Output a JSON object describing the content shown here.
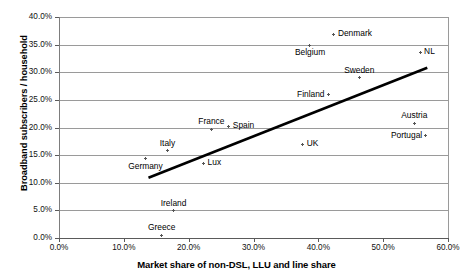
{
  "chart_data": {
    "type": "scatter",
    "title": "",
    "xlabel": "Market share of non-DSL, LLU and line share",
    "ylabel": "Broadband subscribers / household",
    "xlim": [
      0,
      60
    ],
    "ylim": [
      0,
      40
    ],
    "xticks": [
      "0.0%",
      "10.0%",
      "20.0%",
      "30.0%",
      "40.0%",
      "50.0%",
      "60.0%"
    ],
    "xtick_values": [
      0,
      10,
      20,
      30,
      40,
      50,
      60
    ],
    "yticks": [
      "0.0%",
      "5.0%",
      "10.0%",
      "15.0%",
      "20.0%",
      "25.0%",
      "30.0%",
      "35.0%",
      "40.0%"
    ],
    "ytick_values": [
      0,
      5,
      10,
      15,
      20,
      25,
      30,
      35,
      40
    ],
    "grid": "horizontal",
    "legend": "none",
    "marker": "plus",
    "points": [
      {
        "label": "Denmark",
        "x": 42.4,
        "y": 36.9,
        "label_pos": "right"
      },
      {
        "label": "Belgium",
        "x": 38.7,
        "y": 34.9,
        "label_pos": "below"
      },
      {
        "label": "NL",
        "x": 55.7,
        "y": 33.6,
        "label_pos": "right"
      },
      {
        "label": "Sweden",
        "x": 46.3,
        "y": 29.0,
        "label_pos": "above"
      },
      {
        "label": "Finland",
        "x": 41.5,
        "y": 26.0,
        "label_pos": "left"
      },
      {
        "label": "Austria",
        "x": 54.8,
        "y": 20.8,
        "label_pos": "above"
      },
      {
        "label": "Spain",
        "x": 26.2,
        "y": 20.2,
        "label_pos": "right"
      },
      {
        "label": "France",
        "x": 23.5,
        "y": 19.7,
        "label_pos": "above"
      },
      {
        "label": "Portugal",
        "x": 56.6,
        "y": 18.6,
        "label_pos": "left"
      },
      {
        "label": "UK",
        "x": 37.6,
        "y": 17.0,
        "label_pos": "right"
      },
      {
        "label": "Italy",
        "x": 16.7,
        "y": 15.8,
        "label_pos": "above"
      },
      {
        "label": "Germany",
        "x": 13.3,
        "y": 14.3,
        "label_pos": "below"
      },
      {
        "label": "Lux",
        "x": 22.3,
        "y": 13.5,
        "label_pos": "right"
      },
      {
        "label": "Ireland",
        "x": 17.7,
        "y": 4.9,
        "label_pos": "above"
      },
      {
        "label": "Greece",
        "x": 15.8,
        "y": 0.5,
        "label_pos": "above"
      }
    ],
    "trendline": {
      "x0": 13.8,
      "y0": 10.9,
      "x1": 56.8,
      "y1": 30.8
    }
  },
  "colors": {
    "marker": "#555555",
    "grid": "#9a9a9a",
    "axis": "#5a5a5a",
    "trendline": "#000000",
    "text": "#000000",
    "background": "#ffffff"
  }
}
